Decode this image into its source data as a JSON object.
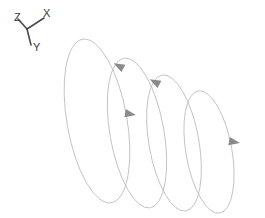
{
  "figure": {
    "background_color": "#ffffff",
    "width": 265,
    "height": 218
  },
  "axis_triad": {
    "name": "coordinate-axis-triad",
    "origin": {
      "x": 27,
      "y": 29
    },
    "line_color": "#4a4a4a",
    "label_color": "#3a3a3a",
    "axes": [
      {
        "id": "z",
        "label": "Z",
        "tip": {
          "x": 18,
          "y": 19
        },
        "label_pos": {
          "x": 14,
          "y": 21
        }
      },
      {
        "id": "x",
        "label": "X",
        "tip": {
          "x": 44,
          "y": 18
        },
        "label_pos": {
          "x": 43,
          "y": 17
        }
      },
      {
        "id": "y",
        "label": "Y",
        "tip": {
          "x": 31,
          "y": 45
        },
        "label_pos": {
          "x": 33,
          "y": 51
        }
      }
    ]
  },
  "helix": {
    "name": "helix-curve",
    "stroke_color": "#b9b9b9",
    "stroke_width": 0.8,
    "arrow_color": "#8a8a8a",
    "loop_count": 4,
    "loops": [
      {
        "index": 1,
        "center": {
          "x": 97,
          "y": 121
        },
        "rx": 30,
        "ry": 83,
        "rotation": -10
      },
      {
        "index": 2,
        "center": {
          "x": 137,
          "y": 133
        },
        "rx": 27,
        "ry": 76,
        "rotation": -10
      },
      {
        "index": 3,
        "center": {
          "x": 174,
          "y": 143
        },
        "rx": 25,
        "ry": 69,
        "rotation": -10
      },
      {
        "index": 4,
        "center": {
          "x": 209,
          "y": 152
        },
        "rx": 23,
        "ry": 62,
        "rotation": -10
      }
    ],
    "arrows": [
      {
        "id": "arrow-1",
        "x": 119,
        "y": 66,
        "angle": -62,
        "direction": "up-right"
      },
      {
        "id": "arrow-2",
        "x": 130,
        "y": 114,
        "angle": 100,
        "direction": "down"
      },
      {
        "id": "arrow-3",
        "x": 155,
        "y": 82,
        "angle": -62,
        "direction": "up-right"
      },
      {
        "id": "arrow-4",
        "x": 234,
        "y": 142,
        "angle": 100,
        "direction": "down"
      }
    ]
  }
}
